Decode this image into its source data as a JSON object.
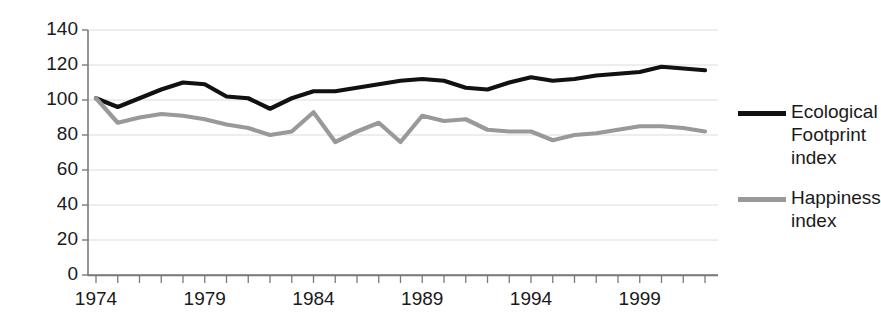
{
  "chart_data": {
    "type": "line",
    "title": "",
    "xlabel": "",
    "ylabel": "",
    "xlim": [
      1974,
      2002
    ],
    "ylim": [
      0,
      140
    ],
    "yticks": [
      0,
      20,
      40,
      60,
      80,
      100,
      120,
      140
    ],
    "xticks_labeled": [
      1974,
      1979,
      1984,
      1989,
      1994,
      1999
    ],
    "xtick_step": 1,
    "grid": "horizontal",
    "legend_position": "right",
    "x": [
      1974,
      1975,
      1976,
      1977,
      1978,
      1979,
      1980,
      1981,
      1982,
      1983,
      1984,
      1985,
      1986,
      1987,
      1988,
      1989,
      1990,
      1991,
      1992,
      1993,
      1994,
      1995,
      1996,
      1997,
      1998,
      1999,
      2000,
      2001,
      2002
    ],
    "series": [
      {
        "name": "Ecological Footprint index",
        "color": "#111111",
        "values": [
          101,
          96,
          101,
          106,
          110,
          109,
          102,
          101,
          95,
          101,
          105,
          105,
          107,
          109,
          111,
          112,
          111,
          107,
          106,
          110,
          113,
          111,
          112,
          114,
          115,
          116,
          119,
          118,
          117
        ]
      },
      {
        "name": "Happiness index",
        "color": "#999999",
        "values": [
          101,
          87,
          90,
          92,
          91,
          89,
          86,
          84,
          80,
          82,
          93,
          76,
          82,
          87,
          76,
          91,
          88,
          89,
          83,
          82,
          82,
          77,
          80,
          81,
          83,
          85,
          85,
          84,
          82
        ]
      }
    ]
  },
  "legend": {
    "items": [
      {
        "label": "Ecological Footprint index",
        "color": "#111111"
      },
      {
        "label": "Happiness index",
        "color": "#999999"
      }
    ]
  },
  "axes": {
    "y_tick_labels": [
      "140",
      "120",
      "100",
      "80",
      "60",
      "40",
      "20",
      "0"
    ],
    "x_tick_labels": [
      "1974",
      "1979",
      "1984",
      "1989",
      "1994",
      "1999"
    ]
  }
}
